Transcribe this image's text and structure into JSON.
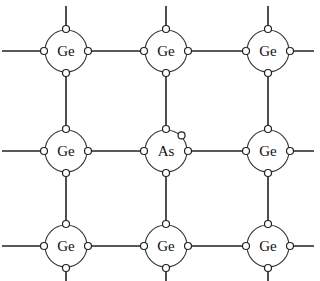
{
  "diagram": {
    "caption_partial": "",
    "grid": {
      "columns_x": [
        66,
        166,
        268
      ],
      "rows_y": [
        51,
        151,
        246
      ],
      "atom_radius": 21,
      "electron_radius": 3.5,
      "electron_offset": 22
    },
    "atoms": [
      {
        "id": "r0c0",
        "label": "Ge",
        "row": 0,
        "col": 0,
        "extra_electron": false
      },
      {
        "id": "r0c1",
        "label": "Ge",
        "row": 0,
        "col": 1,
        "extra_electron": false
      },
      {
        "id": "r0c2",
        "label": "Ge",
        "row": 0,
        "col": 2,
        "extra_electron": false
      },
      {
        "id": "r1c0",
        "label": "Ge",
        "row": 1,
        "col": 0,
        "extra_electron": false
      },
      {
        "id": "r1c1",
        "label": "As",
        "row": 1,
        "col": 1,
        "extra_electron": true
      },
      {
        "id": "r1c2",
        "label": "Ge",
        "row": 1,
        "col": 2,
        "extra_electron": false
      },
      {
        "id": "r2c0",
        "label": "Ge",
        "row": 2,
        "col": 0,
        "extra_electron": false
      },
      {
        "id": "r2c1",
        "label": "Ge",
        "row": 2,
        "col": 1,
        "extra_electron": false
      },
      {
        "id": "r2c2",
        "label": "Ge",
        "row": 2,
        "col": 2,
        "extra_electron": false
      }
    ],
    "bond_extent": {
      "left_x": 2,
      "right_x": 314,
      "top_y": 6,
      "bottom_y": 281
    },
    "colors": {
      "line": "#222222",
      "atom_fill": "#ffffff",
      "background": "#ffffff"
    }
  }
}
